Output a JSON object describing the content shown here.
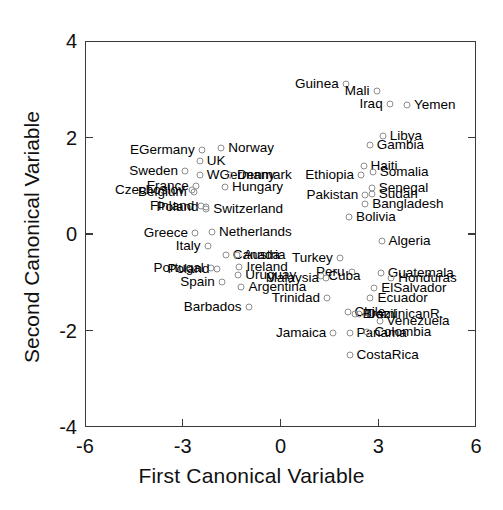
{
  "chart_data": {
    "type": "scatter",
    "title": "",
    "xlabel": "First Canonical Variable",
    "ylabel": "Second Canonical Variable",
    "xlim": [
      -6,
      6
    ],
    "ylim": [
      -4,
      4
    ],
    "xticks": [
      "-6",
      "-3",
      "0",
      "3",
      "6"
    ],
    "xtick_values": [
      -6,
      -3,
      0,
      3,
      6
    ],
    "yticks": [
      "4",
      "2",
      "0",
      "-2",
      "-4"
    ],
    "ytick_values": [
      4,
      2,
      0,
      -2,
      -4
    ],
    "grid": false,
    "legend": "none",
    "marker": "open-circle",
    "points": [
      {
        "label": "Guinea",
        "x": 2.0,
        "y": 3.1,
        "side": "right"
      },
      {
        "label": "Mali",
        "x": 2.95,
        "y": 2.96,
        "side": "right"
      },
      {
        "label": "Iraq",
        "x": 3.35,
        "y": 2.7,
        "side": "right"
      },
      {
        "label": "Yemen",
        "x": 3.88,
        "y": 2.68,
        "side": "left"
      },
      {
        "label": "Libya",
        "x": 3.14,
        "y": 2.03,
        "side": "left"
      },
      {
        "label": "Gambia",
        "x": 2.74,
        "y": 1.85,
        "side": "left"
      },
      {
        "label": "Haiti",
        "x": 2.55,
        "y": 1.4,
        "side": "left"
      },
      {
        "label": "Somalia",
        "x": 2.83,
        "y": 1.28,
        "side": "left"
      },
      {
        "label": "Ethiopia",
        "x": 2.47,
        "y": 1.22,
        "side": "right"
      },
      {
        "label": "Senegal",
        "x": 2.8,
        "y": 0.95,
        "side": "left"
      },
      {
        "label": "Sudan",
        "x": 2.8,
        "y": 0.83,
        "side": "left"
      },
      {
        "label": "Pakistan",
        "x": 2.6,
        "y": 0.8,
        "side": "right"
      },
      {
        "label": "Bangladesh",
        "x": 2.6,
        "y": 0.62,
        "side": "left"
      },
      {
        "label": "Bolivia",
        "x": 2.1,
        "y": 0.36,
        "side": "left"
      },
      {
        "label": "Algeria",
        "x": 3.1,
        "y": -0.14,
        "side": "left"
      },
      {
        "label": "Turkey",
        "x": 1.82,
        "y": -0.5,
        "side": "right"
      },
      {
        "label": "Peru",
        "x": 2.18,
        "y": -0.78,
        "side": "right"
      },
      {
        "label": "Guatemala",
        "x": 3.08,
        "y": -0.8,
        "side": "left"
      },
      {
        "label": "Honduras",
        "x": 3.4,
        "y": -0.92,
        "side": "left"
      },
      {
        "label": "Cuba",
        "x": 1.25,
        "y": -0.88,
        "side": "left"
      },
      {
        "label": "Malaysia",
        "x": 1.4,
        "y": -0.92,
        "side": "right"
      },
      {
        "label": "ElSalvador",
        "x": 2.88,
        "y": -1.12,
        "side": "left"
      },
      {
        "label": "Ecuador",
        "x": 2.76,
        "y": -1.32,
        "side": "left"
      },
      {
        "label": "Trinidad",
        "x": 1.43,
        "y": -1.33,
        "side": "right"
      },
      {
        "label": "Chile",
        "x": 2.06,
        "y": -1.62,
        "side": "left"
      },
      {
        "label": "Brazil",
        "x": 2.3,
        "y": -1.66,
        "side": "left"
      },
      {
        "label": "DominicanR.",
        "x": 2.42,
        "y": -1.66,
        "side": "left"
      },
      {
        "label": "Venezuela",
        "x": 3.04,
        "y": -1.8,
        "side": "left"
      },
      {
        "label": "Jamaica",
        "x": 1.62,
        "y": -2.06,
        "side": "right"
      },
      {
        "label": "Panama",
        "x": 2.12,
        "y": -2.06,
        "side": "left"
      },
      {
        "label": "Colombia",
        "x": 2.66,
        "y": -2.04,
        "side": "left"
      },
      {
        "label": "CostaRica",
        "x": 2.12,
        "y": -2.5,
        "side": "left"
      },
      {
        "label": "EGermany",
        "x": -2.42,
        "y": 1.75,
        "side": "right"
      },
      {
        "label": "Norway",
        "x": -1.82,
        "y": 1.78,
        "side": "left"
      },
      {
        "label": "UK",
        "x": -2.48,
        "y": 1.52,
        "side": "left"
      },
      {
        "label": "Sweden",
        "x": -2.93,
        "y": 1.3,
        "side": "right"
      },
      {
        "label": "WGermany",
        "x": -2.48,
        "y": 1.22,
        "side": "left"
      },
      {
        "label": "Denmark",
        "x": -1.55,
        "y": 1.22,
        "side": "left"
      },
      {
        "label": "France",
        "x": -2.6,
        "y": 1.0,
        "side": "right"
      },
      {
        "label": "Hungary",
        "x": -1.7,
        "y": 0.98,
        "side": "left"
      },
      {
        "label": "Czechoslov",
        "x": -2.72,
        "y": 0.92,
        "side": "right"
      },
      {
        "label": "Belgium",
        "x": -2.66,
        "y": 0.88,
        "side": "right"
      },
      {
        "label": "Finland",
        "x": -2.43,
        "y": 0.58,
        "side": "right"
      },
      {
        "label": "Poland",
        "x": -2.3,
        "y": 0.55,
        "side": "right"
      },
      {
        "label": "Switzerland",
        "x": -2.28,
        "y": 0.52,
        "side": "left"
      },
      {
        "label": "Greece",
        "x": -2.62,
        "y": 0.02,
        "side": "right"
      },
      {
        "label": "Netherlands",
        "x": -2.1,
        "y": 0.04,
        "side": "left"
      },
      {
        "label": "Italy",
        "x": -2.24,
        "y": -0.24,
        "side": "right"
      },
      {
        "label": "Canada",
        "x": -1.68,
        "y": -0.44,
        "side": "left"
      },
      {
        "label": "Austria",
        "x": -1.35,
        "y": -0.44,
        "side": "left"
      },
      {
        "label": "Portugal",
        "x": -2.14,
        "y": -0.7,
        "side": "right"
      },
      {
        "label": "Poland2",
        "x": -1.96,
        "y": -0.72,
        "side": "right"
      },
      {
        "label": "Ireland",
        "x": -1.26,
        "y": -0.68,
        "side": "left"
      },
      {
        "label": "Uruguay",
        "x": -1.3,
        "y": -0.86,
        "side": "left"
      },
      {
        "label": "Spain",
        "x": -1.8,
        "y": -1.0,
        "side": "right"
      },
      {
        "label": "Argentina",
        "x": -1.2,
        "y": -1.1,
        "side": "left"
      },
      {
        "label": "Barbados",
        "x": -0.98,
        "y": -1.52,
        "side": "right"
      }
    ]
  },
  "axes": {
    "x_title": "First Canonical Variable",
    "y_title": "Second Canonical Variable"
  }
}
